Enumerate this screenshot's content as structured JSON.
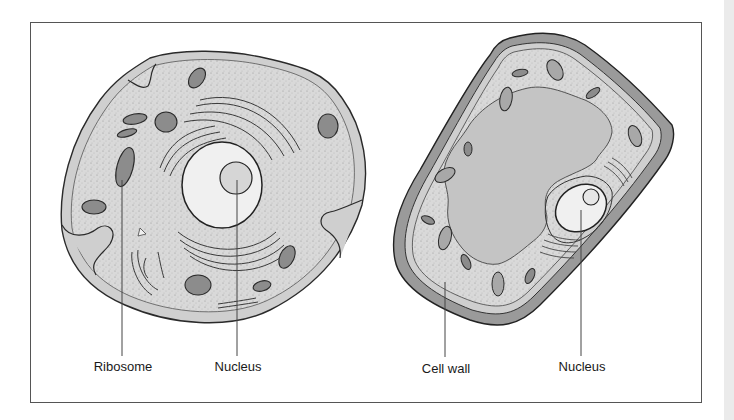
{
  "figure": {
    "type": "cell-comparison-diagram",
    "panels": [
      {
        "id": "animal-cell",
        "labels": [
          {
            "text": "Ribosome",
            "x": 123,
            "y": 358
          },
          {
            "text": "Nucleus",
            "x": 238,
            "y": 358
          }
        ]
      },
      {
        "id": "plant-cell",
        "labels": [
          {
            "text": "Cell wall",
            "x": 446,
            "y": 360
          },
          {
            "text": "Nucleus",
            "x": 582,
            "y": 358
          }
        ]
      }
    ],
    "colors": {
      "frame_border": "#555555",
      "outline": "#2a2a2a",
      "membrane_fill": "#cfcfcf",
      "cytoplasm_fill": "#d9d9d9",
      "nucleus_fill": "#f0f0f0",
      "nucleolus_fill": "#d6d6d6",
      "organelle_fill": "#8c8c8c",
      "cell_wall_fill": "#9a9a9a",
      "vacuole_fill": "#c4c4c4",
      "leader_line": "#444444"
    }
  },
  "labels": {
    "animal_ribosome": "Ribosome",
    "animal_nucleus": "Nucleus",
    "plant_cell_wall": "Cell wall",
    "plant_nucleus": "Nucleus"
  }
}
